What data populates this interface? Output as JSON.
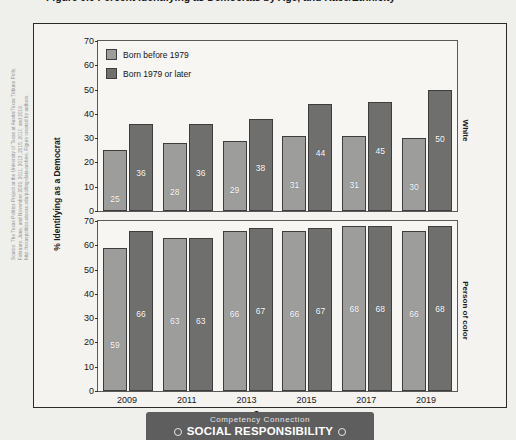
{
  "figure": {
    "title": "Figure 9.6 Percent Identifying as Democrats by Age, and Race/Ethnicity",
    "source_note": "Source: The Texas Politics Project at the University of Texas at Austin/Texas Tribune Polls, February, June, and November 2009, 2011, 2013, 2015, 2017, and 2019; http://texaspolitics.utexas.edu/polling-data-archive. Figure created by authors."
  },
  "banner": {
    "eyebrow": "Competency Connection",
    "title": "SOCIAL RESPONSIBILITY",
    "dot_icon": "circle-icon"
  },
  "colors": {
    "bar_light": "#9d9d9b",
    "bar_dark": "#6f6f6e",
    "frame": "#2a2a2a",
    "panel_bg": "#f7f6f3",
    "page_bg": "#efefec",
    "banner_bg": "#5e5e5e"
  },
  "chart_data": {
    "type": "bar",
    "title": "Figure 9.6 Percent Identifying as Democrats by Age, and Race/Ethnicity",
    "xlabel": "Survey year",
    "ylabel": "% Identifying as a Democrat",
    "categories": [
      "2009",
      "2011",
      "2013",
      "2015",
      "2017",
      "2019"
    ],
    "yticks": [
      0,
      10,
      20,
      30,
      40,
      50,
      60,
      70
    ],
    "ylim": [
      0,
      70
    ],
    "grid": false,
    "legend_position": "top-left",
    "legend": [
      "Born before 1979",
      "Born 1979 or later"
    ],
    "panels": [
      {
        "label": "White",
        "series": [
          {
            "name": "Born before 1979",
            "values": [
              25,
              28,
              29,
              31,
              31,
              30
            ]
          },
          {
            "name": "Born 1979 or later",
            "values": [
              36,
              36,
              38,
              44,
              45,
              50
            ]
          }
        ]
      },
      {
        "label": "Person of color",
        "series": [
          {
            "name": "Born before 1979",
            "values": [
              59,
              63,
              66,
              66,
              68,
              66
            ]
          },
          {
            "name": "Born 1979 or later",
            "values": [
              66,
              63,
              67,
              67,
              68,
              68
            ]
          }
        ]
      }
    ]
  }
}
